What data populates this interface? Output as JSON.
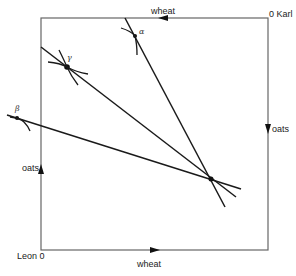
{
  "diagram": {
    "type": "edgeworth-box",
    "origins": {
      "bottom_left": "Leon 0",
      "top_right": "0 Karl"
    },
    "axis_labels": {
      "top": "wheat",
      "bottom": "wheat",
      "left": "oats",
      "right": "oats"
    },
    "points": {
      "alpha": "α",
      "beta": "β",
      "gamma": "γ"
    },
    "colors": {
      "lines": "#1a1a1a",
      "box": "#555555"
    }
  }
}
